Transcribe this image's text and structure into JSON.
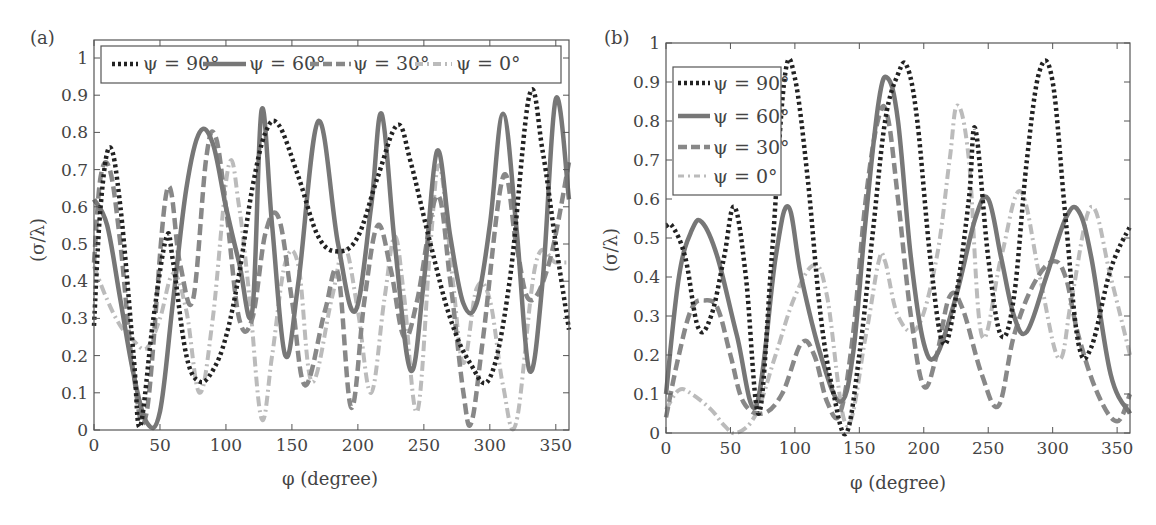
{
  "chart_data": [
    {
      "panel": "(a)",
      "type": "line",
      "xlabel": "φ (degree)",
      "ylabel": "(σ/λ)",
      "xlim": [
        0,
        360
      ],
      "ylim": [
        0,
        1.05
      ],
      "xticks": [
        0,
        50,
        100,
        150,
        200,
        250,
        300,
        350
      ],
      "yticks": [
        0,
        0.1,
        0.2,
        0.3,
        0.4,
        0.5,
        0.6,
        0.7,
        0.8,
        0.9,
        1
      ],
      "legend_position": "top (horizontal)",
      "grid": false,
      "series": [
        {
          "name": "ψ = 90°",
          "style": "dotted",
          "color": "#222222",
          "x": [
            0,
            5,
            12,
            20,
            30,
            35,
            45,
            55,
            60,
            70,
            80,
            90,
            100,
            110,
            120,
            130,
            140,
            155,
            170,
            185,
            200,
            215,
            230,
            240,
            255,
            270,
            285,
            300,
            315,
            330,
            340,
            350,
            360
          ],
          "y": [
            0.28,
            0.6,
            0.76,
            0.6,
            0.2,
            0.01,
            0.3,
            0.52,
            0.45,
            0.2,
            0.13,
            0.16,
            0.25,
            0.42,
            0.65,
            0.8,
            0.82,
            0.68,
            0.52,
            0.48,
            0.52,
            0.68,
            0.82,
            0.72,
            0.5,
            0.3,
            0.18,
            0.14,
            0.4,
            0.9,
            0.75,
            0.5,
            0.27
          ]
        },
        {
          "name": "ψ = 60°",
          "style": "solid",
          "color": "#777777",
          "x": [
            0,
            10,
            20,
            30,
            40,
            50,
            60,
            70,
            80,
            90,
            100,
            110,
            120,
            127,
            135,
            145,
            155,
            170,
            185,
            198,
            210,
            218,
            228,
            240,
            250,
            260,
            270,
            280,
            290,
            300,
            310,
            320,
            330,
            340,
            350,
            360
          ],
          "y": [
            0.62,
            0.55,
            0.35,
            0.15,
            0.02,
            0.05,
            0.35,
            0.65,
            0.8,
            0.77,
            0.6,
            0.45,
            0.32,
            0.86,
            0.55,
            0.2,
            0.4,
            0.83,
            0.5,
            0.32,
            0.6,
            0.85,
            0.5,
            0.16,
            0.4,
            0.75,
            0.52,
            0.34,
            0.34,
            0.55,
            0.85,
            0.55,
            0.16,
            0.4,
            0.89,
            0.62
          ]
        },
        {
          "name": "ψ = 30°",
          "style": "dashed",
          "color": "#888888",
          "x": [
            0,
            5,
            12,
            20,
            30,
            40,
            55,
            65,
            75,
            85,
            92,
            100,
            110,
            120,
            130,
            140,
            150,
            160,
            175,
            185,
            195,
            205,
            215,
            225,
            235,
            245,
            260,
            270,
            280,
            286,
            295,
            310,
            320,
            330,
            345,
            360
          ],
          "y": [
            0.45,
            0.68,
            0.7,
            0.5,
            0.15,
            0.05,
            0.64,
            0.45,
            0.35,
            0.73,
            0.79,
            0.6,
            0.3,
            0.3,
            0.53,
            0.57,
            0.35,
            0.12,
            0.32,
            0.42,
            0.06,
            0.35,
            0.55,
            0.43,
            0.25,
            0.35,
            0.63,
            0.4,
            0.1,
            0.02,
            0.25,
            0.68,
            0.5,
            0.35,
            0.45,
            0.72
          ]
        },
        {
          "name": "ψ = 0°",
          "style": "dashdot",
          "color": "#bbbbbb",
          "x": [
            0,
            10,
            20,
            30,
            40,
            50,
            60,
            70,
            80,
            90,
            102,
            110,
            118,
            127,
            135,
            145,
            155,
            165,
            180,
            190,
            200,
            210,
            220,
            228,
            235,
            245,
            255,
            262,
            272,
            280,
            290,
            300,
            310,
            320,
            335,
            350,
            360
          ],
          "y": [
            0.44,
            0.35,
            0.28,
            0.24,
            0.22,
            0.3,
            0.42,
            0.32,
            0.1,
            0.3,
            0.71,
            0.6,
            0.35,
            0.03,
            0.2,
            0.45,
            0.44,
            0.13,
            0.35,
            0.49,
            0.32,
            0.1,
            0.35,
            0.52,
            0.36,
            0.05,
            0.5,
            0.71,
            0.4,
            0.18,
            0.38,
            0.35,
            0.12,
            0.02,
            0.45,
            0.45,
            0.45
          ]
        }
      ]
    },
    {
      "panel": "(b)",
      "type": "line",
      "xlabel": "φ (degree)",
      "ylabel": "(σ/λ)",
      "xlim": [
        0,
        360
      ],
      "ylim": [
        0,
        1
      ],
      "xticks": [
        0,
        50,
        100,
        150,
        200,
        250,
        300,
        350
      ],
      "yticks": [
        0,
        0.1,
        0.2,
        0.3,
        0.4,
        0.5,
        0.6,
        0.7,
        0.8,
        0.9,
        1
      ],
      "legend_position": "upper left (vertical)",
      "grid": false,
      "series": [
        {
          "name": "ψ = 90°",
          "style": "dotted",
          "color": "#222222",
          "x": [
            0,
            5,
            15,
            25,
            35,
            45,
            53,
            62,
            72,
            82,
            92,
            100,
            110,
            120,
            130,
            140,
            150,
            160,
            170,
            180,
            187,
            195,
            205,
            215,
            225,
            235,
            240,
            250,
            260,
            270,
            280,
            290,
            300,
            310,
            320,
            330,
            345,
            360
          ],
          "y": [
            0.53,
            0.53,
            0.45,
            0.27,
            0.3,
            0.45,
            0.58,
            0.4,
            0.05,
            0.45,
            0.91,
            0.91,
            0.65,
            0.3,
            0.1,
            0.0,
            0.2,
            0.5,
            0.8,
            0.92,
            0.94,
            0.8,
            0.45,
            0.23,
            0.35,
            0.6,
            0.78,
            0.45,
            0.25,
            0.35,
            0.7,
            0.93,
            0.9,
            0.55,
            0.23,
            0.22,
            0.42,
            0.53
          ]
        },
        {
          "name": "ψ = 60°",
          "style": "solid",
          "color": "#777777",
          "x": [
            0,
            10,
            20,
            28,
            40,
            55,
            70,
            85,
            95,
            105,
            120,
            135,
            145,
            155,
            165,
            172,
            180,
            190,
            200,
            210,
            225,
            240,
            250,
            260,
            270,
            280,
            295,
            310,
            320,
            330,
            345,
            360
          ],
          "y": [
            0.1,
            0.4,
            0.52,
            0.54,
            0.45,
            0.25,
            0.07,
            0.45,
            0.58,
            0.4,
            0.2,
            0.08,
            0.2,
            0.55,
            0.85,
            0.91,
            0.8,
            0.45,
            0.23,
            0.2,
            0.35,
            0.55,
            0.6,
            0.45,
            0.3,
            0.26,
            0.4,
            0.55,
            0.57,
            0.45,
            0.15,
            0.05
          ]
        },
        {
          "name": "ψ = 30°",
          "style": "dashed",
          "color": "#888888",
          "x": [
            0,
            10,
            20,
            30,
            40,
            50,
            60,
            75,
            90,
            105,
            115,
            125,
            135,
            145,
            155,
            165,
            172,
            180,
            190,
            200,
            210,
            220,
            230,
            245,
            258,
            270,
            285,
            300,
            310,
            320,
            335,
            350,
            360
          ],
          "y": [
            0.04,
            0.2,
            0.32,
            0.34,
            0.32,
            0.2,
            0.08,
            0.05,
            0.1,
            0.23,
            0.2,
            0.08,
            0.05,
            0.25,
            0.6,
            0.81,
            0.81,
            0.6,
            0.3,
            0.12,
            0.2,
            0.35,
            0.32,
            0.15,
            0.07,
            0.25,
            0.38,
            0.44,
            0.4,
            0.25,
            0.1,
            0.03,
            0.1
          ]
        },
        {
          "name": "ψ = 0°",
          "style": "dashdot",
          "color": "#bbbbbb",
          "x": [
            0,
            10,
            20,
            35,
            45,
            55,
            70,
            85,
            100,
            115,
            125,
            140,
            155,
            165,
            170,
            180,
            195,
            210,
            220,
            226,
            235,
            245,
            260,
            275,
            290,
            305,
            315,
            330,
            345,
            360
          ],
          "y": [
            0.06,
            0.11,
            0.1,
            0.06,
            0.02,
            0.0,
            0.05,
            0.2,
            0.35,
            0.43,
            0.35,
            0.02,
            0.25,
            0.44,
            0.44,
            0.3,
            0.27,
            0.45,
            0.7,
            0.84,
            0.7,
            0.25,
            0.45,
            0.62,
            0.4,
            0.19,
            0.35,
            0.58,
            0.4,
            0.2
          ]
        }
      ]
    }
  ],
  "panels": [
    {
      "label": "(a)",
      "xlabel": "φ (degree)",
      "ylabel": "(σ/λ)",
      "xtick_labels": [
        "0",
        "50",
        "100",
        "150",
        "200",
        "250",
        "300",
        "350"
      ],
      "ytick_labels": [
        "0",
        "0.1",
        "0.2",
        "0.3",
        "0.4",
        "0.5",
        "0.6",
        "0.7",
        "0.8",
        "0.9",
        "1"
      ],
      "legend": [
        "ψ = 90°",
        "ψ = 60°",
        "ψ = 30°",
        "ψ = 0°"
      ]
    },
    {
      "label": "(b)",
      "xlabel": "φ (degree)",
      "ylabel": "(σ/λ)",
      "xtick_labels": [
        "0",
        "50",
        "100",
        "150",
        "200",
        "250",
        "300",
        "350"
      ],
      "ytick_labels": [
        "0",
        "0.1",
        "0.2",
        "0.3",
        "0.4",
        "0.5",
        "0.6",
        "0.7",
        "0.8",
        "0.9",
        "1"
      ],
      "legend": [
        "ψ = 90°",
        "ψ = 60°",
        "ψ = 30°",
        "ψ = 0°"
      ]
    }
  ]
}
